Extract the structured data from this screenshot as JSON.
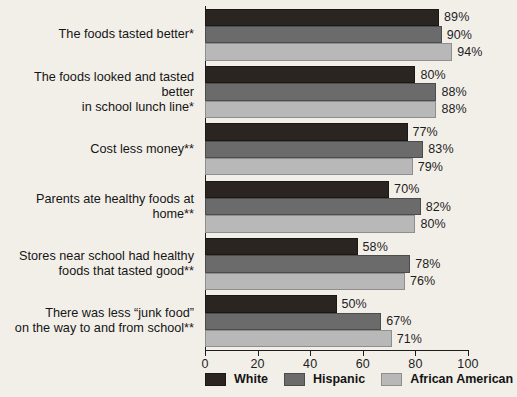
{
  "chart_data": {
    "type": "bar",
    "orientation": "horizontal",
    "title": "",
    "xlabel": "",
    "ylabel": "",
    "xlim": [
      0,
      100
    ],
    "xticks": [
      0,
      20,
      40,
      60,
      80,
      100
    ],
    "grid": false,
    "legend_position": "bottom",
    "categories": [
      "The foods tasted better*",
      "The foods looked and tasted better\nin school lunch line*",
      "Cost less money**",
      "Parents ate healthy foods at home**",
      "Stores near school had healthy\nfoods that tasted good**",
      "There was less “junk food”\non the way to and from school**"
    ],
    "series": [
      {
        "name": "White",
        "color": "#2b2522",
        "values": [
          89,
          80,
          77,
          70,
          58,
          50
        ]
      },
      {
        "name": "Hispanic",
        "color": "#6b6b6b",
        "values": [
          90,
          88,
          83,
          82,
          78,
          67
        ]
      },
      {
        "name": "African American",
        "color": "#b8b8b8",
        "values": [
          94,
          88,
          79,
          80,
          76,
          71
        ]
      }
    ],
    "value_labels": [
      [
        "89%",
        "90%",
        "94%"
      ],
      [
        "80%",
        "88%",
        "88%"
      ],
      [
        "77%",
        "83%",
        "79%"
      ],
      [
        "70%",
        "82%",
        "80%"
      ],
      [
        "58%",
        "78%",
        "76%"
      ],
      [
        "50%",
        "67%",
        "71%"
      ]
    ],
    "tick_labels": [
      "0",
      "20",
      "40",
      "60",
      "80",
      "100"
    ]
  },
  "legend": {
    "items": [
      {
        "label": "White"
      },
      {
        "label": "Hispanic"
      },
      {
        "label": "African American"
      }
    ]
  }
}
